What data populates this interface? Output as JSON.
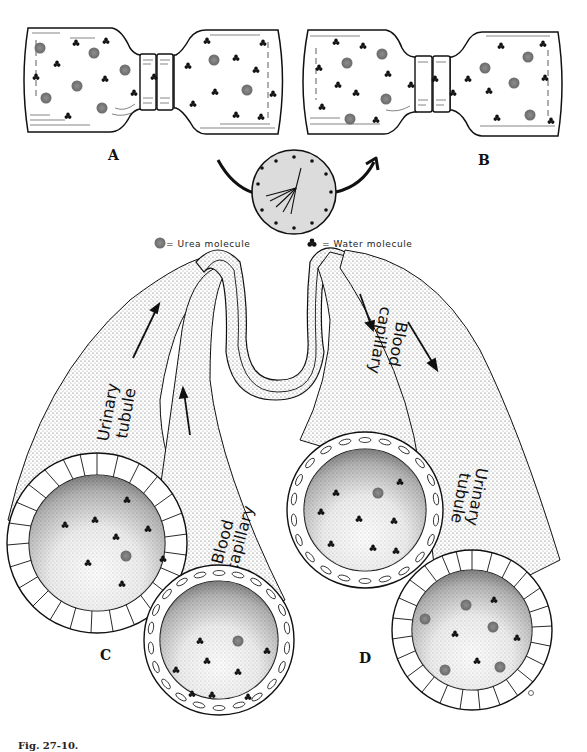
{
  "figure": {
    "panels": {
      "A": "A",
      "B": "B",
      "C": "C",
      "D": "D"
    },
    "legend": {
      "urea_label": "= Urea molecule",
      "water_label": "= Water molecule"
    },
    "labels": {
      "c_urinary_line1": "Urinary",
      "c_urinary_line2": "tubule",
      "c_blood_line1": "Blood",
      "c_blood_line2": "capillary",
      "d_blood_line1": "Blood",
      "d_blood_line2": "capillary",
      "d_urinary_line1": "Urinary",
      "d_urinary_line2": "tubule"
    },
    "caption": "Fig. 27-10.",
    "colors": {
      "ink": "#111111",
      "urea": "#7a7a7a",
      "stipple": "#cfcfcf",
      "paper": "#ffffff"
    }
  }
}
